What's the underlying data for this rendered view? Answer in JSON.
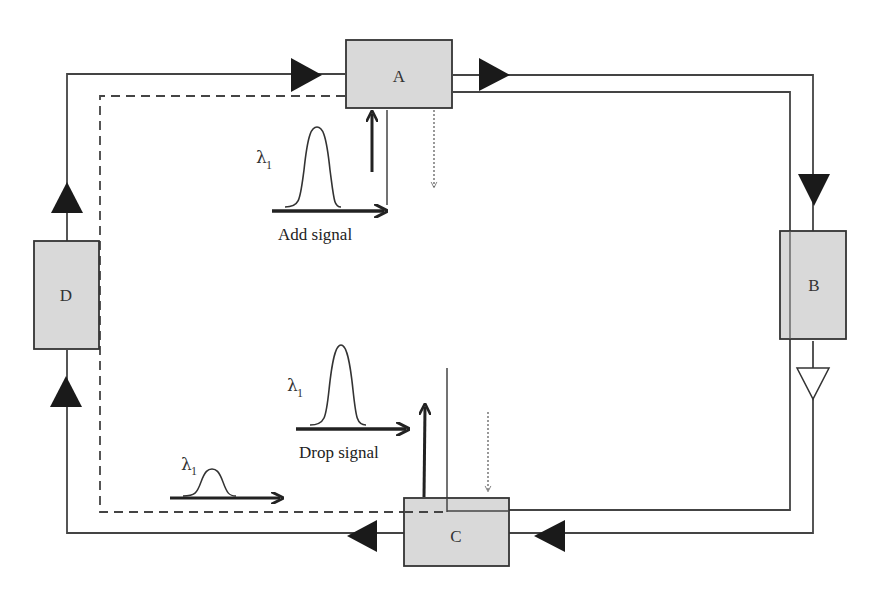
{
  "diagram": {
    "type": "optical ring network with add/drop multiplexing",
    "nodes": [
      {
        "id": "A",
        "label": "A"
      },
      {
        "id": "B",
        "label": "B"
      },
      {
        "id": "C",
        "label": "C"
      },
      {
        "id": "D",
        "label": "D"
      }
    ],
    "signals": {
      "add": {
        "label": "Add signal",
        "wavelength": "λ",
        "wavelength_sub": "1"
      },
      "drop": {
        "label": "Drop signal",
        "wavelength": "λ",
        "wavelength_sub": "1"
      },
      "passthrough": {
        "wavelength": "λ",
        "wavelength_sub": "1"
      }
    },
    "colors": {
      "node_fill": "#d9d9d9",
      "line": "#444444",
      "arrow": "#1a1a1a"
    }
  }
}
